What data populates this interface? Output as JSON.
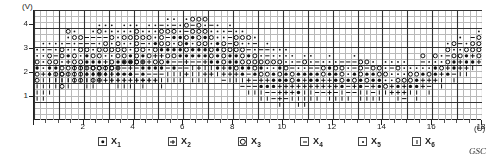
{
  "axes": {
    "y_unit": "(V)",
    "x_unit": "(U)",
    "y_ticks": [
      "1",
      "2",
      "3",
      "4"
    ],
    "x_ticks": [
      "2",
      "4",
      "6",
      "8",
      "10",
      "12",
      "14",
      "16",
      "18"
    ],
    "x_range": [
      0,
      18
    ],
    "y_range": [
      0,
      4.6
    ],
    "grid": true
  },
  "legend": {
    "items": [
      {
        "symbol": "filled-dot",
        "label": "X",
        "sub": "1"
      },
      {
        "symbol": "plus",
        "label": "X",
        "sub": "2"
      },
      {
        "symbol": "circle",
        "label": "X",
        "sub": "3"
      },
      {
        "symbol": "dash",
        "label": "X",
        "sub": "4"
      },
      {
        "symbol": "small-dot",
        "label": "X",
        "sub": "5"
      },
      {
        "symbol": "vertical-bar",
        "label": "X",
        "sub": "6"
      }
    ]
  },
  "credit": "GSC",
  "chart_data": {
    "type": "heatmap",
    "title": "",
    "xlabel": "(U)",
    "ylabel": "(V)",
    "xlim": [
      0,
      18
    ],
    "ylim": [
      0,
      4.6
    ],
    "cell_size_u": 0.25,
    "cell_size_v": 0.12,
    "symbol_classes": [
      "X1",
      "X2",
      "X3",
      "X4",
      "X5",
      "X6"
    ],
    "symbol_glyphs": {
      "X1": "filled-dot",
      "X2": "plus",
      "X3": "circle",
      "X4": "dash",
      "X5": "small-dot",
      "X6": "vertical-bar"
    },
    "colors": {
      "ink": "#111111",
      "grid": "#b9b9b9",
      "axis": "#222222"
    },
    "note": "Classified discriminant cell plot: each grid cell holds a class symbol.",
    "cells": [
      {
        "col": 2,
        "row": 6,
        "sym": "X6"
      },
      {
        "col": 3,
        "row": 6,
        "sym": "X6"
      },
      {
        "col": 4,
        "row": 6,
        "sym": "X6"
      },
      {
        "col": 5,
        "row": 6,
        "sym": "X6"
      },
      {
        "col": 6,
        "row": 6,
        "sym": "X6"
      },
      {
        "col": 7,
        "row": 6,
        "sym": "X6"
      },
      {
        "col": 8,
        "row": 6,
        "sym": "X6"
      },
      {
        "col": 9,
        "row": 6,
        "sym": "X6"
      },
      {
        "col": 10,
        "row": 6,
        "sym": "X2"
      },
      {
        "col": 11,
        "row": 6,
        "sym": "X2"
      },
      {
        "col": 12,
        "row": 6,
        "sym": "X2"
      },
      {
        "col": 13,
        "row": 6,
        "sym": "X2"
      },
      {
        "col": 14,
        "row": 6,
        "sym": "X2"
      },
      {
        "col": 15,
        "row": 6,
        "sym": "X2"
      },
      {
        "col": 16,
        "row": 6,
        "sym": "X2"
      },
      {
        "col": 17,
        "row": 6,
        "sym": "X2"
      },
      {
        "col": 18,
        "row": 6,
        "sym": "X2"
      },
      {
        "col": 19,
        "row": 6,
        "sym": "X2"
      },
      {
        "col": 2,
        "row": 7,
        "sym": "X6"
      },
      {
        "col": 3,
        "row": 7,
        "sym": "X3"
      },
      {
        "col": 4,
        "row": 7,
        "sym": "X3"
      },
      {
        "col": 5,
        "row": 7,
        "sym": "X6"
      },
      {
        "col": 6,
        "row": 7,
        "sym": "X3"
      },
      {
        "col": 7,
        "row": 7,
        "sym": "X3"
      },
      {
        "col": 8,
        "row": 7,
        "sym": "X1"
      },
      {
        "col": 9,
        "row": 7,
        "sym": "X1"
      },
      {
        "col": 10,
        "row": 7,
        "sym": "X1"
      },
      {
        "col": 11,
        "row": 7,
        "sym": "X1"
      },
      {
        "col": 12,
        "row": 7,
        "sym": "X2"
      },
      {
        "col": 13,
        "row": 7,
        "sym": "X1"
      },
      {
        "col": 14,
        "row": 7,
        "sym": "X1"
      },
      {
        "col": 15,
        "row": 7,
        "sym": "X1"
      },
      {
        "col": 6,
        "row": 8,
        "sym": "X3"
      },
      {
        "col": 7,
        "row": 8,
        "sym": "X3"
      },
      {
        "col": 8,
        "row": 8,
        "sym": "X3"
      },
      {
        "col": 9,
        "row": 8,
        "sym": "X3"
      },
      {
        "col": 10,
        "row": 8,
        "sym": "X3"
      },
      {
        "col": 11,
        "row": 8,
        "sym": "X3"
      },
      {
        "col": 12,
        "row": 8,
        "sym": "X3"
      },
      {
        "col": 13,
        "row": 8,
        "sym": "X3"
      },
      {
        "col": 14,
        "row": 9,
        "sym": "X3"
      },
      {
        "col": 15,
        "row": 9,
        "sym": "X3"
      },
      {
        "col": 16,
        "row": 9,
        "sym": "X3"
      },
      {
        "col": 17,
        "row": 9,
        "sym": "X3"
      }
    ]
  }
}
